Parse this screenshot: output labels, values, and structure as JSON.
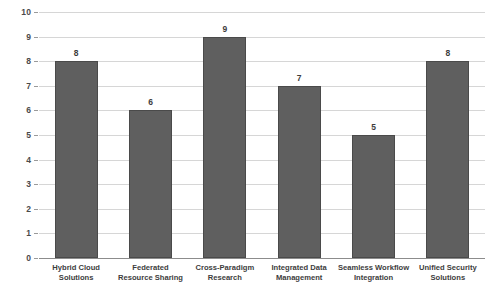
{
  "chart_data": {
    "type": "bar",
    "title": "",
    "subtitle": "",
    "xlabel": "",
    "ylabel": "",
    "ylim": [
      0,
      10
    ],
    "ytick_labels": [
      "0",
      "1",
      "2",
      "3",
      "4",
      "5",
      "6",
      "7",
      "8",
      "9",
      "10"
    ],
    "grid": true,
    "legend": "none",
    "categories": [
      "Hybrid Cloud Solutions",
      "Federated Resource Sharing",
      "Cross-Paradigm Research",
      "Integrated Data Management",
      "Seamless Workflow Integration",
      "Unified Security Solutions"
    ],
    "values": [
      8,
      6,
      9,
      7,
      5,
      8
    ],
    "value_labels": [
      "8",
      "6",
      "9",
      "7",
      "5",
      "8"
    ],
    "bar_color": "#5f5f5f",
    "bar_border_color": "#4a4a4a",
    "gridline_color": "#d6d6d6",
    "axis_color": "#8c8c8c"
  },
  "cropped": {
    "top_title_fragment": "",
    "bottom_caption_fragment": ""
  }
}
